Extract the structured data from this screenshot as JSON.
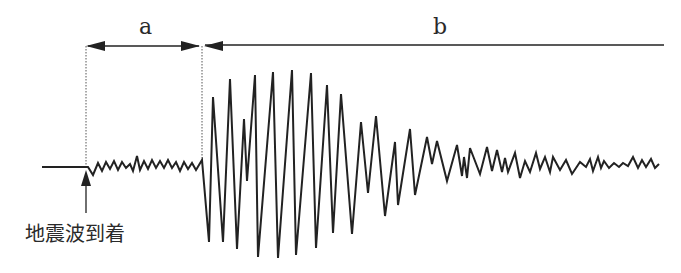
{
  "diagram": {
    "type": "seismogram",
    "labels": {
      "interval_a": "a",
      "interval_b": "b",
      "arrival": "地震波到着"
    },
    "colors": {
      "line": "#222222",
      "background": "#ffffff"
    },
    "waveform_points": "42,167 88,167 93,175 98,163 102,171 106,162 110,169 114,161 118,170 122,162 126,168 130,164 133,171 137,156 140,170 144,161 148,169 152,160 156,168 160,161 164,168 168,160 172,168 176,162 180,171 184,162 188,169 192,163 196,170 202,160 209,242 213,97 223,242 230,79 237,249 244,119 247,181 255,75 258,257 273,72 278,258 292,70 296,255 311,73 316,248 327,85 333,233 341,94 352,234 361,122 368,193 376,116 385,216 395,142 398,205 410,129 415,195 427,137 432,164 437,141 447,181 457,145 462,176 464,157 467,178 470,148 480,174 487,147 492,171 497,150 502,172 505,158 508,172 515,153 520,178 525,161 530,172 536,153 540,169 545,157 550,172 553,157 560,170 566,160 572,174 580,162 586,167 590,159 593,171 598,157 601,168 604,161 609,168 614,163 619,167 623,163 628,166 633,157 638,168 642,160 646,167 651,159 655,168 659,164"
  }
}
